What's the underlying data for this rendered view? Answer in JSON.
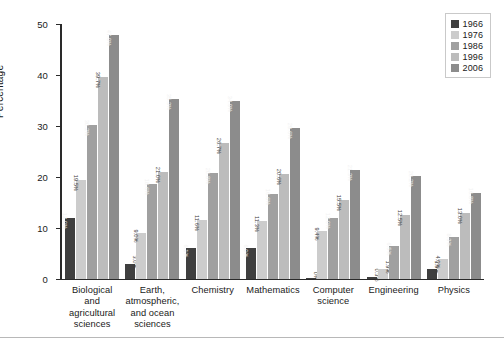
{
  "chart_data": {
    "type": "bar",
    "title": "",
    "xlabel": "",
    "ylabel": "Percentage",
    "ylim": [
      0,
      50
    ],
    "yticks": [
      "0",
      "10",
      "20",
      "30",
      "40",
      "50"
    ],
    "grid": false,
    "legend_position": "top-right",
    "categories": [
      "Biological and agricultural sciences",
      "Earth, atmospheric, and ocean sciences",
      "Chemistry",
      "Mathematics",
      "Computer science",
      "Engineering",
      "Physics"
    ],
    "category_lines": [
      [
        "Biological and",
        "agricultural",
        "sciences"
      ],
      [
        "Earth,",
        "atmospheric,",
        "and ocean",
        "sciences"
      ],
      [
        "Chemistry"
      ],
      [
        "Mathematics"
      ],
      [
        "Computer",
        "science"
      ],
      [
        "Engineering"
      ],
      [
        "Physics"
      ]
    ],
    "series": [
      {
        "name": "1966",
        "color": "#3f3f3f",
        "values": [
          12.0,
          3.0,
          6.1,
          6.0,
          0.0,
          0.3,
          1.9
        ],
        "labels": [
          "12.0%",
          "3.0%",
          "6.1%",
          "6.0%",
          "0%",
          "0.3%",
          "1.9%"
        ]
      },
      {
        "name": "1976",
        "color": "#cccccc",
        "values": [
          19.5,
          9.0,
          11.6,
          11.3,
          9.4,
          1.9,
          4.0
        ],
        "labels": [
          "19.5%",
          "9.0%",
          "11.6%",
          "11.3%",
          "9.4%",
          "1.9%",
          "4.0%"
        ]
      },
      {
        "name": "1986",
        "color": "#a0a0a0",
        "values": [
          30.2,
          18.6,
          20.8,
          16.6,
          12.0,
          6.5,
          8.3
        ],
        "labels": [
          "30.2%",
          "18.6%",
          "20.8%",
          "16.6%",
          "12.0%",
          "6.5%",
          "8.3%"
        ]
      },
      {
        "name": "1996",
        "color": "#bcbcbc",
        "values": [
          39.7,
          21.0,
          26.7,
          20.6,
          15.5,
          12.5,
          13.0
        ],
        "labels": [
          "39.7%",
          "21.0%",
          "26.7%",
          "20.6%",
          "15.5%",
          "12.5%",
          "13.0%"
        ]
      },
      {
        "name": "2006",
        "color": "#8c8c8c",
        "values": [
          47.9,
          35.3,
          34.9,
          29.6,
          21.3,
          20.2,
          16.8
        ],
        "labels": [
          "47.9%",
          "35.3%",
          "34.9%",
          "29.6%",
          "21.3%",
          "20.2%",
          "16.8%"
        ]
      }
    ]
  },
  "legend": {
    "items": [
      {
        "label": "1966",
        "color": "#3f3f3f"
      },
      {
        "label": "1976",
        "color": "#cccccc"
      },
      {
        "label": "1986",
        "color": "#a0a0a0"
      },
      {
        "label": "1996",
        "color": "#bcbcbc"
      },
      {
        "label": "2006",
        "color": "#8c8c8c"
      }
    ]
  },
  "axis": {
    "y_title": "Percentage"
  }
}
